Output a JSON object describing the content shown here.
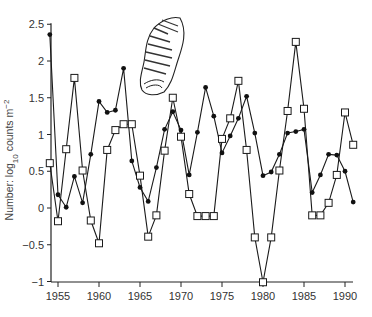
{
  "chart_data": {
    "type": "line",
    "title": "",
    "xlabel": "",
    "ylabel": "Number: log10 counts m-2",
    "ylabel_parts": {
      "prefix": "Number: log",
      "sub": "10",
      "mid": " counts m",
      "sup": "−2"
    },
    "xlim": [
      1954,
      1991
    ],
    "ylim": [
      -1,
      2.5
    ],
    "x_ticks": [
      1955,
      1960,
      1965,
      1970,
      1975,
      1980,
      1985,
      1990
    ],
    "x_tick_labels": [
      "1955",
      "1960",
      "1965",
      "1970",
      "1975",
      "1980",
      "1985",
      "1990"
    ],
    "y_ticks": [
      -1,
      -0.5,
      0,
      0.5,
      1,
      1.5,
      2,
      2.5
    ],
    "y_tick_labels": [
      "−1",
      "−0.5",
      "0",
      "0.5",
      "1",
      "1.5",
      "2",
      "2.5"
    ],
    "grid": false,
    "legend": null,
    "annotation": "snail shell illustration",
    "x": [
      1954,
      1955,
      1956,
      1957,
      1958,
      1959,
      1960,
      1961,
      1962,
      1963,
      1964,
      1965,
      1966,
      1967,
      1968,
      1969,
      1970,
      1971,
      1972,
      1973,
      1974,
      1975,
      1976,
      1977,
      1978,
      1979,
      1980,
      1981,
      1982,
      1983,
      1984,
      1985,
      1986,
      1987,
      1988,
      1989,
      1990,
      1991
    ],
    "series": [
      {
        "name": "filled circles",
        "marker": "filled-circle",
        "values": [
          2.36,
          0.18,
          0.01,
          0.43,
          0.07,
          0.73,
          1.45,
          1.3,
          1.33,
          1.9,
          0.64,
          0.28,
          0.09,
          0.55,
          1.07,
          1.31,
          1.06,
          0.45,
          1.03,
          1.64,
          1.25,
          0.75,
          0.98,
          1.22,
          1.52,
          1.02,
          0.44,
          0.49,
          0.73,
          1.02,
          1.04,
          1.07,
          0.21,
          0.45,
          0.73,
          0.72,
          0.5,
          0.08
        ]
      },
      {
        "name": "open squares",
        "marker": "open-square",
        "values": [
          0.61,
          -0.18,
          0.8,
          1.77,
          0.51,
          -0.17,
          -0.48,
          0.79,
          1.06,
          1.14,
          1.14,
          0.44,
          -0.39,
          -0.1,
          0.78,
          1.5,
          0.97,
          0.19,
          -0.11,
          -0.11,
          -0.11,
          0.94,
          1.22,
          1.73,
          0.79,
          -0.4,
          -1.01,
          -0.4,
          0.51,
          1.32,
          2.26,
          1.35,
          -0.1,
          -0.1,
          0.07,
          0.45,
          1.3,
          0.86
        ]
      }
    ]
  },
  "colors": {
    "axis": "#222222",
    "line": "#1a1a1a",
    "marker_fill_filled": "#111111",
    "marker_fill_open": "#ffffff"
  }
}
